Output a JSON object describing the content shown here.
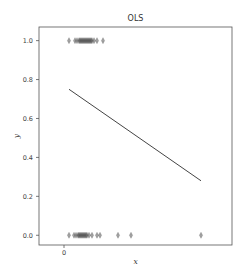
{
  "top_cutoff_text": "━━━━━━━━━━━━━━━━━━━━━━━━━━━",
  "chart_data": {
    "type": "scatter",
    "title": "OLS",
    "xlabel": "x",
    "ylabel": "y",
    "x_ticks": [
      {
        "value": 0,
        "label": "0"
      }
    ],
    "y_ticks": [
      {
        "value": 0.0,
        "label": "0.0"
      },
      {
        "value": 0.2,
        "label": "0.2"
      },
      {
        "value": 0.4,
        "label": "0.4"
      },
      {
        "value": 0.6,
        "label": "0.6"
      },
      {
        "value": 0.8,
        "label": "0.8"
      },
      {
        "value": 1.0,
        "label": "1.0"
      }
    ],
    "ylim": [
      -0.05,
      1.07
    ],
    "xlim": [
      -2.5,
      16.8
    ],
    "grid": false,
    "legend": null,
    "marker": "thin_diamond",
    "series": [
      {
        "name": "y = 1 observations",
        "y": 1.0,
        "x": [
          0.5,
          1.1,
          1.3,
          1.5,
          1.6,
          1.7,
          1.8,
          1.9,
          2.0,
          2.1,
          2.2,
          2.3,
          2.4,
          2.5,
          2.6,
          2.7,
          2.8,
          3.0,
          3.3,
          3.9
        ]
      },
      {
        "name": "y = 0 observations",
        "y": 0.0,
        "x": [
          0.5,
          1.0,
          1.2,
          1.4,
          1.5,
          1.6,
          1.7,
          1.8,
          1.9,
          2.0,
          2.1,
          2.2,
          2.3,
          2.5,
          2.8,
          3.3,
          3.6,
          5.4,
          6.7,
          13.7
        ]
      },
      {
        "name": "OLS fit",
        "type": "line",
        "x": [
          0.5,
          13.7
        ],
        "y": [
          0.75,
          0.28
        ]
      }
    ]
  }
}
